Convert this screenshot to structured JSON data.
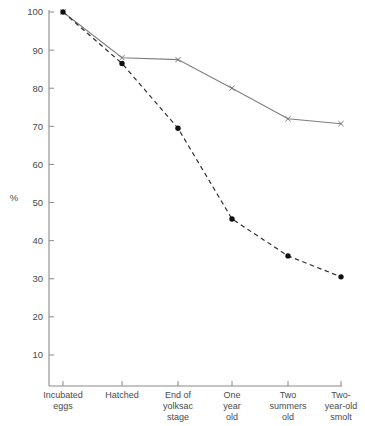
{
  "chart_data": {
    "type": "line",
    "title": "",
    "xlabel": "",
    "ylabel": "%",
    "ylim": [
      0,
      102
    ],
    "grid": false,
    "legend": "none",
    "categories": [
      "Incubated eggs",
      "Hatched",
      "End of yolksac stage",
      "One year old",
      "Two summers old",
      "Two-year-old smolt"
    ],
    "category_lines": [
      [
        "Incubated",
        "eggs"
      ],
      [
        "Hatched"
      ],
      [
        "End of",
        "yolksac",
        "stage"
      ],
      [
        "One",
        "year",
        "old"
      ],
      [
        "Two",
        "summers",
        "old"
      ],
      [
        "Two-",
        "year-old",
        "smolt"
      ]
    ],
    "yticks": [
      10,
      20,
      30,
      40,
      50,
      60,
      70,
      80,
      90,
      100
    ],
    "ytick_labels": [
      "10",
      "20",
      "30",
      "40",
      "50",
      "60",
      "70",
      "80",
      "90",
      "100"
    ],
    "series": [
      {
        "name": "upper-survival-curve",
        "style": "solid",
        "marker": "cross",
        "color": "#7d7d7d",
        "values": [
          100,
          88,
          87.5,
          80,
          72,
          70.7
        ]
      },
      {
        "name": "lower-survival-curve",
        "style": "dashed",
        "marker": "dot",
        "color": "#2b2b2b",
        "values": [
          100,
          86.5,
          69.5,
          45.7,
          36,
          30.5
        ]
      }
    ]
  },
  "colors": {
    "background": "#ffffff",
    "axis": "#8a8a8a",
    "solid_series": "#7d7d7d",
    "dashed_series": "#2b2b2b",
    "text": "#4a4a4a"
  }
}
